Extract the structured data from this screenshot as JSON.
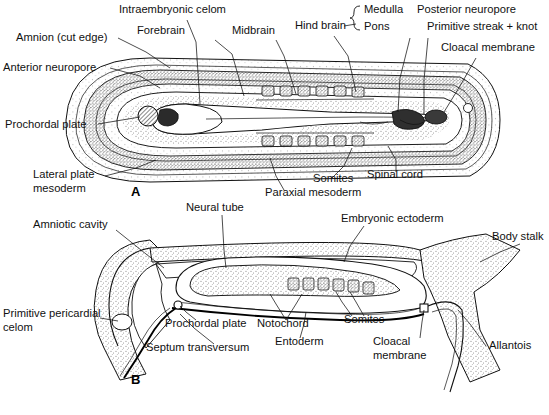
{
  "figure": {
    "background_color": "#ffffff",
    "ink_color": "#111111"
  },
  "panels": [
    {
      "id": "A",
      "letter": "A",
      "name": "dorsal-view-panel",
      "labels": [
        {
          "id": "amnion-cut-edge",
          "text": "Amnion (cut edge)",
          "x": 16,
          "y": 41,
          "anchor": "start"
        },
        {
          "id": "anterior-neuropore",
          "text": "Anterior neuropore",
          "x": 3,
          "y": 71,
          "anchor": "start"
        },
        {
          "id": "intraembryonic-celom",
          "text": "Intraembryonic celom",
          "x": 119,
          "y": 13,
          "anchor": "start"
        },
        {
          "id": "forebrain",
          "text": "Forebrain",
          "x": 137,
          "y": 34,
          "anchor": "start"
        },
        {
          "id": "midbrain",
          "text": "Midbrain",
          "x": 232,
          "y": 34,
          "anchor": "start"
        },
        {
          "id": "hind-brain",
          "text": "Hind brain",
          "x": 295,
          "y": 29,
          "anchor": "start"
        },
        {
          "id": "medulla",
          "text": "Medulla",
          "x": 364,
          "y": 13,
          "anchor": "start"
        },
        {
          "id": "pons",
          "text": "Pons",
          "x": 364,
          "y": 30,
          "anchor": "start"
        },
        {
          "id": "posterior-neuropore",
          "text": "Posterior neuropore",
          "x": 417,
          "y": 13,
          "anchor": "start"
        },
        {
          "id": "primitive-streak-knot",
          "text": "Primitive streak + knot",
          "x": 427,
          "y": 30,
          "anchor": "start"
        },
        {
          "id": "cloacal-membrane-a",
          "text": "Cloacal membrane",
          "x": 441,
          "y": 51,
          "anchor": "start"
        },
        {
          "id": "prochordal-plate-a",
          "text": "Prochordal plate",
          "x": 5,
          "y": 128,
          "anchor": "start"
        },
        {
          "id": "lateral-plate",
          "text": "Lateral plate",
          "x": 33,
          "y": 178,
          "anchor": "start"
        },
        {
          "id": "mesoderm",
          "text": "mesoderm",
          "x": 33,
          "y": 192,
          "anchor": "start"
        },
        {
          "id": "somites-a",
          "text": "Somites",
          "x": 313,
          "y": 182,
          "anchor": "start"
        },
        {
          "id": "spinal-cord",
          "text": "Spinal cord",
          "x": 367,
          "y": 178,
          "anchor": "start"
        },
        {
          "id": "paraxial-mesoderm",
          "text": "Paraxial mesoderm",
          "x": 265,
          "y": 196,
          "anchor": "start"
        }
      ]
    },
    {
      "id": "B",
      "letter": "B",
      "name": "sagittal-section-panel",
      "labels": [
        {
          "id": "neural-tube",
          "text": "Neural tube",
          "x": 186,
          "y": 211,
          "anchor": "start"
        },
        {
          "id": "amniotic-cavity",
          "text": "Amniotic cavity",
          "x": 33,
          "y": 228,
          "anchor": "start"
        },
        {
          "id": "embryonic-ectoderm",
          "text": "Embryonic ectoderm",
          "x": 341,
          "y": 222,
          "anchor": "start"
        },
        {
          "id": "body-stalk",
          "text": "Body stalk",
          "x": 492,
          "y": 240,
          "anchor": "start"
        },
        {
          "id": "primitive-pericardial",
          "text": "Primitive pericardial",
          "x": 3,
          "y": 317,
          "anchor": "start"
        },
        {
          "id": "celom",
          "text": "celom",
          "x": 3,
          "y": 331,
          "anchor": "start"
        },
        {
          "id": "prochordal-plate-b",
          "text": "Prochordal plate",
          "x": 165,
          "y": 327,
          "anchor": "start"
        },
        {
          "id": "notochord",
          "text": "Notochord",
          "x": 257,
          "y": 327,
          "anchor": "start"
        },
        {
          "id": "somites-b",
          "text": "Somites",
          "x": 344,
          "y": 323,
          "anchor": "start"
        },
        {
          "id": "entoderm",
          "text": "Entoderm",
          "x": 275,
          "y": 345,
          "anchor": "start"
        },
        {
          "id": "septum-transversum",
          "text": "Septum transversum",
          "x": 146,
          "y": 351,
          "anchor": "start"
        },
        {
          "id": "cloacal-membrane-b",
          "text": "Cloacal",
          "x": 373,
          "y": 345,
          "anchor": "start"
        },
        {
          "id": "cloacal-membrane-b2",
          "text": "membrane",
          "x": 373,
          "y": 359,
          "anchor": "start"
        },
        {
          "id": "allantois",
          "text": "Allantois",
          "x": 489,
          "y": 349,
          "anchor": "start"
        }
      ]
    }
  ]
}
